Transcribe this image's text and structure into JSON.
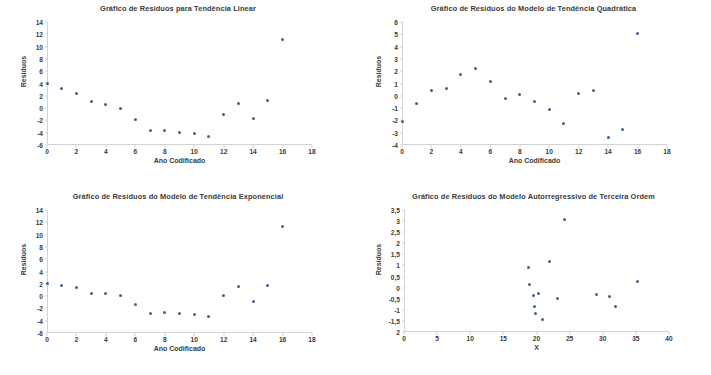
{
  "chart_data": [
    {
      "type": "scatter",
      "panel": "top-left",
      "title": "Gráfico de Resíduos para Tendência Linear",
      "xlabel": "Ano Codificado",
      "ylabel": "Resíduos",
      "xlim": [
        0,
        18
      ],
      "ylim": [
        -6,
        14
      ],
      "xticks": [
        "0",
        "2",
        "4",
        "6",
        "8",
        "10",
        "12",
        "14",
        "16",
        "18"
      ],
      "xtick_values": [
        0,
        2,
        4,
        6,
        8,
        10,
        12,
        14,
        16,
        18
      ],
      "yticks": [
        "-6",
        "-4",
        "-2",
        "0",
        "2",
        "4",
        "6",
        "8",
        "10",
        "12",
        "14"
      ],
      "ytick_values": [
        -6,
        -4,
        -2,
        0,
        2,
        4,
        6,
        8,
        10,
        12,
        14
      ],
      "grid": false,
      "legend": "none",
      "x": [
        0,
        1,
        2,
        3,
        4,
        5,
        6,
        7,
        8,
        9,
        10,
        11,
        12,
        13,
        14,
        15,
        16
      ],
      "y": [
        4.0,
        3.2,
        2.3,
        1.0,
        0.6,
        -0.1,
        -1.9,
        -3.7,
        -3.6,
        -4.0,
        -4.2,
        -4.6,
        -1.1,
        0.7,
        -1.7,
        1.2,
        11.2
      ]
    },
    {
      "type": "scatter",
      "panel": "top-right",
      "title": "Gráfico de Resíduos do Modelo de Tendência Quadrática",
      "xlabel": "Ano Codificado",
      "ylabel": "Resíduos",
      "xlim": [
        0,
        18
      ],
      "ylim": [
        -4,
        6
      ],
      "xticks": [
        "0",
        "2",
        "4",
        "6",
        "8",
        "10",
        "12",
        "14",
        "16",
        "18"
      ],
      "xtick_values": [
        0,
        2,
        4,
        6,
        8,
        10,
        12,
        14,
        16,
        18
      ],
      "yticks": [
        "-4",
        "-3",
        "-2",
        "-1",
        "0",
        "1",
        "2",
        "3",
        "4",
        "5",
        "6"
      ],
      "ytick_values": [
        -4,
        -3,
        -2,
        -1,
        0,
        1,
        2,
        3,
        4,
        5,
        6
      ],
      "grid": false,
      "legend": "none",
      "x": [
        0,
        1,
        2,
        3,
        4,
        5,
        6,
        7,
        8,
        9,
        10,
        11,
        12,
        13,
        14,
        15,
        16
      ],
      "y": [
        -2.1,
        -0.65,
        0.4,
        0.6,
        1.75,
        2.2,
        1.2,
        -0.2,
        0.07,
        -0.5,
        -1.1,
        -2.25,
        0.2,
        0.45,
        -3.4,
        -2.7,
        5.1
      ]
    },
    {
      "type": "scatter",
      "panel": "bottom-left",
      "title": "Gráfico de Resíduos do Modelo de Tendência Exponencial",
      "xlabel": "Ano Codificado",
      "ylabel": "Resíduos",
      "xlim": [
        0,
        18
      ],
      "ylim": [
        -6,
        14
      ],
      "xticks": [
        "0",
        "2",
        "4",
        "6",
        "8",
        "10",
        "12",
        "14",
        "16",
        "18"
      ],
      "xtick_values": [
        0,
        2,
        4,
        6,
        8,
        10,
        12,
        14,
        16,
        18
      ],
      "yticks": [
        "-6",
        "-4",
        "-2",
        "0",
        "2",
        "4",
        "6",
        "8",
        "10",
        "12",
        "14"
      ],
      "ytick_values": [
        -6,
        -4,
        -2,
        0,
        2,
        4,
        6,
        8,
        10,
        12,
        14
      ],
      "grid": false,
      "legend": "none",
      "x": [
        0,
        1,
        2,
        3,
        4,
        5,
        6,
        7,
        8,
        9,
        10,
        11,
        12,
        13,
        14,
        15,
        16
      ],
      "y": [
        2.1,
        1.8,
        1.4,
        0.4,
        0.45,
        0.15,
        -1.35,
        -2.9,
        -2.6,
        -2.9,
        -2.95,
        -3.35,
        0.15,
        1.6,
        -0.85,
        1.7,
        11.3
      ]
    },
    {
      "type": "scatter",
      "panel": "bottom-right",
      "title": "Gráfico de Resíduos do Modelo Autorregressivo de Terceira Ordem",
      "xlabel": "X",
      "ylabel": "Resíduos",
      "xlim": [
        0,
        40
      ],
      "ylim": [
        -2,
        3.5
      ],
      "xticks": [
        "0",
        "5",
        "10",
        "15",
        "20",
        "25",
        "30",
        "35",
        "40"
      ],
      "xtick_values": [
        0,
        5,
        10,
        15,
        20,
        25,
        30,
        35,
        40
      ],
      "yticks": [
        "2",
        "-1,5",
        "-1",
        "-0,5",
        "0",
        "0,5",
        "1",
        "1,5",
        "2",
        "2,5",
        "3",
        "3,5"
      ],
      "ytick_values": [
        -2,
        -1.5,
        -1,
        -0.5,
        0,
        0.5,
        1,
        1.5,
        2,
        2.5,
        3,
        3.5
      ],
      "grid": false,
      "legend": "none",
      "x": [
        18.8,
        18.9,
        19.6,
        19.7,
        19.9,
        20.1,
        20.3,
        20.9,
        21.1,
        22.0,
        23.2,
        24.2,
        29.0,
        31.0,
        31.9,
        35.2
      ],
      "y": [
        0.9,
        0.15,
        -0.35,
        -0.85,
        -1.15,
        -0.25,
        -1.42,
        1.2,
        3.05,
        -0.48,
        -0.3,
        -0.38,
        -0.85,
        0.27,
        0.0,
        0.0
      ]
    }
  ],
  "points": {
    "p1": [
      {
        "x": 0,
        "y": 4.0
      },
      {
        "x": 1,
        "y": 3.2
      },
      {
        "x": 2,
        "y": 2.3
      },
      {
        "x": 3,
        "y": 1.0
      },
      {
        "x": 4,
        "y": 0.6
      },
      {
        "x": 5,
        "y": -0.1
      },
      {
        "x": 6,
        "y": -1.9
      },
      {
        "x": 7,
        "y": -3.7
      },
      {
        "x": 8,
        "y": -3.6
      },
      {
        "x": 9,
        "y": -4.0
      },
      {
        "x": 10,
        "y": -4.2
      },
      {
        "x": 11,
        "y": -4.6
      },
      {
        "x": 12,
        "y": -1.1
      },
      {
        "x": 13,
        "y": 0.7
      },
      {
        "x": 14,
        "y": -1.7
      },
      {
        "x": 15,
        "y": 1.2
      },
      {
        "x": 16,
        "y": 11.2
      }
    ],
    "p2": [
      {
        "x": 0,
        "y": -2.1
      },
      {
        "x": 1,
        "y": -0.65
      },
      {
        "x": 2,
        "y": 0.4
      },
      {
        "x": 3,
        "y": 0.6
      },
      {
        "x": 4,
        "y": 1.75
      },
      {
        "x": 5,
        "y": 2.2
      },
      {
        "x": 6,
        "y": 1.2
      },
      {
        "x": 7,
        "y": -0.2
      },
      {
        "x": 8,
        "y": 0.07
      },
      {
        "x": 9,
        "y": -0.5
      },
      {
        "x": 10,
        "y": -1.1
      },
      {
        "x": 11,
        "y": -2.25
      },
      {
        "x": 12,
        "y": 0.2
      },
      {
        "x": 13,
        "y": 0.45
      },
      {
        "x": 14,
        "y": -3.4
      },
      {
        "x": 15,
        "y": -2.7
      },
      {
        "x": 16,
        "y": 5.1
      }
    ],
    "p3": [
      {
        "x": 0,
        "y": 2.1
      },
      {
        "x": 1,
        "y": 1.8
      },
      {
        "x": 2,
        "y": 1.4
      },
      {
        "x": 3,
        "y": 0.4
      },
      {
        "x": 4,
        "y": 0.45
      },
      {
        "x": 5,
        "y": 0.15
      },
      {
        "x": 6,
        "y": -1.35
      },
      {
        "x": 7,
        "y": -2.9
      },
      {
        "x": 8,
        "y": -2.6
      },
      {
        "x": 9,
        "y": -2.9
      },
      {
        "x": 10,
        "y": -2.95
      },
      {
        "x": 11,
        "y": -3.35
      },
      {
        "x": 12,
        "y": 0.15
      },
      {
        "x": 13,
        "y": 1.6
      },
      {
        "x": 14,
        "y": -0.85
      },
      {
        "x": 15,
        "y": 1.7
      },
      {
        "x": 16,
        "y": 11.3
      }
    ],
    "p4": [
      {
        "x": 18.8,
        "y": 0.9
      },
      {
        "x": 18.9,
        "y": 0.15
      },
      {
        "x": 19.6,
        "y": -0.35
      },
      {
        "x": 19.7,
        "y": -0.85
      },
      {
        "x": 19.9,
        "y": -1.15
      },
      {
        "x": 20.3,
        "y": -0.25
      },
      {
        "x": 20.9,
        "y": -1.42
      },
      {
        "x": 22.0,
        "y": 1.2
      },
      {
        "x": 24.2,
        "y": 3.05
      },
      {
        "x": 23.2,
        "y": -0.48
      },
      {
        "x": 29.0,
        "y": -0.3
      },
      {
        "x": 31.0,
        "y": -0.38
      },
      {
        "x": 31.9,
        "y": -0.85
      },
      {
        "x": 35.2,
        "y": 0.27
      }
    ]
  },
  "colors": {
    "marker": "#40618f",
    "axis": "#d3d3d3",
    "text": "#3b3b3b",
    "background": "#ffffff"
  }
}
